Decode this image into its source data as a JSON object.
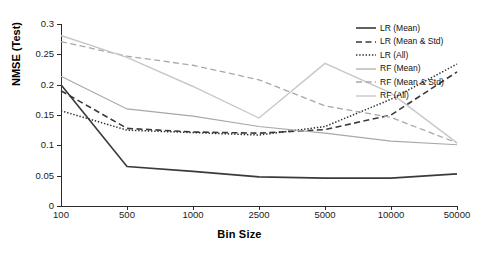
{
  "chart_data": {
    "type": "line",
    "title": "",
    "xlabel": "Bin Size",
    "ylabel": "NMSE (Test)",
    "categories": [
      "100",
      "500",
      "1000",
      "2500",
      "5000",
      "10000",
      "50000"
    ],
    "xscale": "categorical",
    "ylim": [
      0,
      0.3
    ],
    "yticks": [
      "0",
      "0.05",
      "0.1",
      "0.15",
      "0.2",
      "0.25",
      "0.3"
    ],
    "ytick_values": [
      0,
      0.05,
      0.1,
      0.15,
      0.2,
      0.25,
      0.3
    ],
    "grid": false,
    "legend_position": "upper right",
    "series": [
      {
        "name": "LR (Mean)",
        "style": "solid",
        "color": "#3a3a3a",
        "width": 1.6,
        "values": [
          0.2,
          0.065,
          0.057,
          0.048,
          0.046,
          0.046,
          0.053
        ]
      },
      {
        "name": "LR (Mean & Std)",
        "style": "dashed",
        "color": "#3a3a3a",
        "width": 1.6,
        "values": [
          0.19,
          0.128,
          0.122,
          0.12,
          0.126,
          0.15,
          0.221
        ]
      },
      {
        "name": "LR (All)",
        "style": "dotted",
        "color": "#2e2e2e",
        "width": 1.5,
        "values": [
          0.157,
          0.125,
          0.121,
          0.117,
          0.131,
          0.176,
          0.234
        ]
      },
      {
        "name": "RF (Mean)",
        "style": "solid",
        "color": "#a8a8a8",
        "width": 1.2,
        "values": [
          0.214,
          0.16,
          0.148,
          0.131,
          0.12,
          0.107,
          0.101
        ]
      },
      {
        "name": "RF (Mean & Std)",
        "style": "dashed",
        "color": "#a8a8a8",
        "width": 1.3,
        "values": [
          0.271,
          0.247,
          0.232,
          0.208,
          0.165,
          0.146,
          0.104
        ]
      },
      {
        "name": "RF (All)",
        "style": "solid",
        "color": "#c8c8c8",
        "width": 1.4,
        "values": [
          0.281,
          0.245,
          0.197,
          0.145,
          0.235,
          0.186,
          0.104
        ]
      }
    ]
  },
  "legend": {
    "items": [
      {
        "label": "LR (Mean)"
      },
      {
        "label": "LR (Mean & Std)"
      },
      {
        "label": "LR (All)"
      },
      {
        "label": "RF (Mean)"
      },
      {
        "label": "RF (Mean & Std)"
      },
      {
        "label": "RF (All)"
      }
    ]
  }
}
